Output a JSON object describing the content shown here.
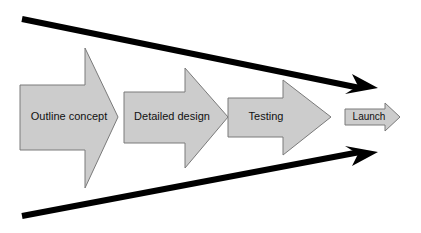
{
  "diagram": {
    "background_color": "#ffffff",
    "stage_fill": "#cccccc",
    "stage_stroke": "#7a7a7a",
    "funnel_color": "#000000",
    "label_color": "#111111",
    "stages": [
      {
        "id": "outline-concept",
        "label": "Outline concept",
        "order": 1,
        "shape": "block-arrow",
        "label_x": 69,
        "label_y": 117,
        "font_class": "label-lg",
        "points": "20,85 85,85 85,48 118,117 85,188 85,150 20,150"
      },
      {
        "id": "detailed-design",
        "label": "Detailed design",
        "order": 2,
        "shape": "block-arrow",
        "label_x": 172,
        "label_y": 117,
        "font_class": "label-lg",
        "points": "124,92 185,92 185,68 228,117 185,168 185,143 124,143"
      },
      {
        "id": "testing",
        "label": "Testing",
        "order": 3,
        "shape": "block-arrow",
        "label_x": 266,
        "label_y": 117,
        "font_class": "label-lg",
        "points": "228,98 283,98 283,80 331,117 283,155 283,137 228,137"
      },
      {
        "id": "launch",
        "label": "Launch",
        "order": 4,
        "shape": "block-arrow",
        "label_x": 369,
        "label_y": 117,
        "font_class": "label-sm",
        "points": "345,109 385,109 385,103 400,117 385,131 385,125 345,125"
      }
    ],
    "funnel_arrows": [
      {
        "id": "funnel-arrow-top",
        "direction": "right",
        "start_x": 22,
        "start_y": 19,
        "end_x": 378,
        "end_y": 88,
        "thickness": 6,
        "head_points": "378,88 352,74 358,86 345,94"
      },
      {
        "id": "funnel-arrow-bottom",
        "direction": "right",
        "start_x": 22,
        "start_y": 216,
        "end_x": 378,
        "end_y": 152,
        "thickness": 6,
        "head_points": "378,152 345,146 358,154 352,166"
      }
    ]
  }
}
